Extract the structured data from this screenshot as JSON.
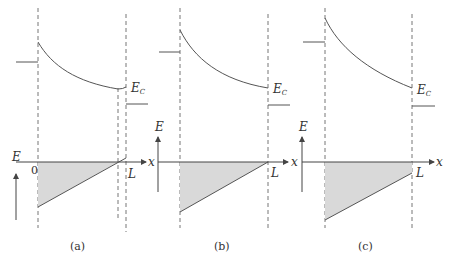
{
  "figure": {
    "panels": [
      {
        "id": "a",
        "caption": "(a)",
        "ec_label": "E",
        "ec_sub": "C",
        "e_axis_label": "E",
        "x_axis_label": "x",
        "origin_label": "0",
        "length_label": "L",
        "description": "Depletion region narrower than L; field crosses zero before x = L"
      },
      {
        "id": "b",
        "caption": "(b)",
        "ec_label": "E",
        "ec_sub": "C",
        "e_axis_label": "E",
        "x_axis_label": "x",
        "length_label": "L",
        "description": "Field reaches zero exactly at x = L"
      },
      {
        "id": "c",
        "caption": "(c)",
        "ec_label": "E",
        "ec_sub": "C",
        "e_axis_label": "E",
        "x_axis_label": "x",
        "length_label": "L",
        "description": "Punch-through: field remains negative at x = L"
      }
    ],
    "colors": {
      "line": "#555555",
      "dashed": "#666666",
      "fill": "#d9d9d9"
    }
  }
}
